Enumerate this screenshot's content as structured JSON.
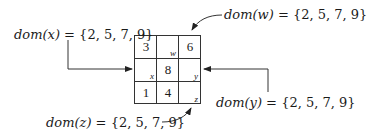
{
  "diagram": {
    "type": "sudoku-constraint-grid",
    "grid": {
      "rows": 3,
      "cols": 3,
      "cells": [
        {
          "row": 0,
          "col": 0,
          "value": "3",
          "var": ""
        },
        {
          "row": 0,
          "col": 1,
          "value": "",
          "var": "w"
        },
        {
          "row": 0,
          "col": 2,
          "value": "6",
          "var": ""
        },
        {
          "row": 1,
          "col": 0,
          "value": "",
          "var": "x"
        },
        {
          "row": 1,
          "col": 1,
          "value": "8",
          "var": ""
        },
        {
          "row": 1,
          "col": 2,
          "value": "",
          "var": "y"
        },
        {
          "row": 2,
          "col": 0,
          "value": "1",
          "var": ""
        },
        {
          "row": 2,
          "col": 1,
          "value": "4",
          "var": ""
        },
        {
          "row": 2,
          "col": 2,
          "value": "",
          "var": "z"
        }
      ]
    },
    "labels": {
      "x": {
        "prefix": "dom(x)",
        "text": " = {2, 5, 7, 9}"
      },
      "w": {
        "prefix": "dom(w)",
        "text": " = {2, 5, 7, 9}"
      },
      "y": {
        "prefix": "dom(y)",
        "text": " = {2, 5, 7, 9}"
      },
      "z": {
        "prefix": "dom(z)",
        "text": " = {2, 5, 7, 9}"
      }
    },
    "colors": {
      "line": "#333333",
      "text": "#1a1a1a",
      "background": "#ffffff"
    }
  }
}
